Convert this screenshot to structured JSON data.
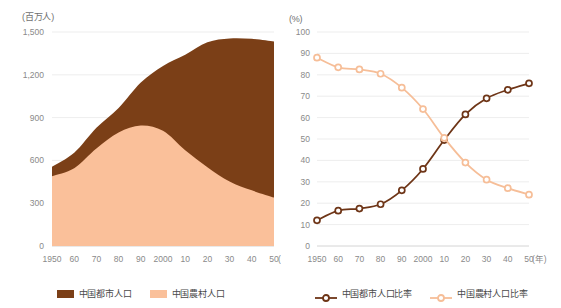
{
  "charts": {
    "left": {
      "unit_label": "(百万人)",
      "x_unit_label": "(年)",
      "legend": [
        {
          "label": "中国都市人口",
          "color": "#7B3F17",
          "marker": "square"
        },
        {
          "label": "中国農村人口",
          "color": "#FAC09A",
          "marker": "square"
        }
      ]
    },
    "right": {
      "unit_label": "(%)",
      "x_unit_label": "(年)",
      "legend": [
        {
          "label": "中国都市人口比率",
          "color": "#6E3517",
          "marker": "circle-line"
        },
        {
          "label": "中国農村人口比率",
          "color": "#F6BE98",
          "marker": "circle-line"
        }
      ]
    }
  },
  "chart_data": [
    {
      "type": "area",
      "title": "",
      "subtitle": "",
      "xlabel": "(年)",
      "ylabel": "(百万人)",
      "stacked": true,
      "grid": true,
      "legend_position": "bottom",
      "xlim": [
        1950,
        2050
      ],
      "ylim": [
        0,
        1500
      ],
      "ytick_labels": [
        "0",
        "300",
        "600",
        "900",
        "1,200",
        "1,500"
      ],
      "yticks": [
        0,
        300,
        600,
        900,
        1200,
        1500
      ],
      "xtick_labels": [
        "1950",
        "60",
        "70",
        "80",
        "90",
        "2000",
        "10",
        "20",
        "30",
        "40",
        "50"
      ],
      "x": [
        1950,
        1960,
        1970,
        1980,
        1990,
        2000,
        2010,
        2020,
        2030,
        2040,
        2050
      ],
      "series": [
        {
          "name": "中国農村人口",
          "color": "#FAC09A",
          "values": [
            489,
            545,
            683,
            795,
            844,
            807,
            671,
            552,
            452,
            390,
            340
          ]
        },
        {
          "name": "中国都市人口",
          "color": "#7B3F17",
          "values": [
            66,
            108,
            145,
            172,
            302,
            455,
            669,
            876,
            1003,
            1062,
            1093
          ]
        }
      ],
      "totals": [
        555,
        653,
        828,
        967,
        1146,
        1262,
        1340,
        1428,
        1455,
        1452,
        1433
      ]
    },
    {
      "type": "line",
      "title": "",
      "subtitle": "",
      "xlabel": "(年)",
      "ylabel": "(%)",
      "grid": true,
      "legend_position": "bottom",
      "markers": "open-circle",
      "xlim": [
        1950,
        2050
      ],
      "ylim": [
        0,
        100
      ],
      "ytick_labels": [
        "0",
        "10",
        "20",
        "30",
        "40",
        "50",
        "60",
        "70",
        "80",
        "90",
        "100"
      ],
      "yticks": [
        0,
        10,
        20,
        30,
        40,
        50,
        60,
        70,
        80,
        90,
        100
      ],
      "xtick_labels": [
        "1950",
        "60",
        "70",
        "80",
        "90",
        "2000",
        "10",
        "20",
        "30",
        "40",
        "50"
      ],
      "x": [
        1950,
        1960,
        1970,
        1980,
        1990,
        2000,
        2010,
        2020,
        2030,
        2040,
        2050
      ],
      "series": [
        {
          "name": "中国都市人口比率",
          "color": "#6E3517",
          "values": [
            12,
            16.5,
            17.5,
            19.5,
            26,
            36,
            49.5,
            61.5,
            69,
            73,
            76
          ]
        },
        {
          "name": "中国農村人口比率",
          "color": "#F6BE98",
          "values": [
            88,
            83.5,
            82.5,
            80.5,
            74,
            64,
            50.5,
            39,
            31,
            27,
            24
          ]
        }
      ]
    }
  ]
}
